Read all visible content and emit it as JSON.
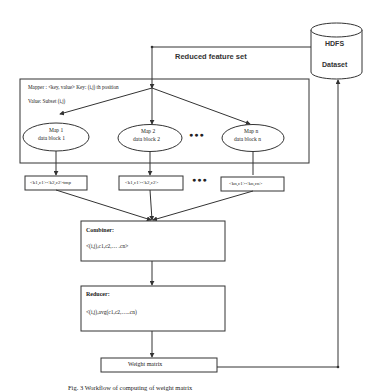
{
  "diagram": {
    "source": {
      "label_line1": "HDFS",
      "label_line2": "Dataset",
      "shape": "cylinder-icon"
    },
    "feedback_edge_label": "Reduced feature set",
    "mapper": {
      "line1": "Mapper : <key, value> Key: (i,j) th position",
      "line2": "Value: Subset (i,j)",
      "maps": [
        {
          "title": "Map 1",
          "subtitle": "data block 1",
          "output": "<k1,c1><k2,c2>tmp"
        },
        {
          "title": "Map 2",
          "subtitle": "data block 2",
          "output": "<k1,c1><k2,c2>"
        },
        {
          "title": "Map n",
          "subtitle": "data block n",
          "output": "<kn,c1><kn,cn>"
        }
      ],
      "ellipsis": "●●●"
    },
    "combiner": {
      "title": "Combiner:",
      "body": "<(i,j),c1,c2,… .cn>"
    },
    "reducer": {
      "title": "Reducer:",
      "body": "<(i,j),avg(c1,c2,…..cn)"
    },
    "output": {
      "label": "Weight matrix"
    },
    "caption": "Fig. 3 Workflow of computing of weight matrix",
    "colors": {
      "stroke": "#333333",
      "text": "#222222",
      "background": "#ffffff"
    }
  }
}
